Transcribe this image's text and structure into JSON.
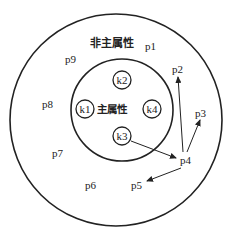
{
  "diagram": {
    "outer_label": "非主属性",
    "inner_label": "主属性",
    "key_nodes": [
      {
        "id": "k1",
        "label": "k1",
        "x": 85,
        "y": 109
      },
      {
        "id": "k2",
        "label": "k2",
        "x": 122,
        "y": 80
      },
      {
        "id": "k3",
        "label": "k3",
        "x": 122,
        "y": 136
      },
      {
        "id": "k4",
        "label": "k4",
        "x": 153,
        "y": 109
      }
    ],
    "points": [
      {
        "id": "p1",
        "label": "p1",
        "x": 150,
        "y": 48
      },
      {
        "id": "p2",
        "label": "p2",
        "x": 179,
        "y": 73
      },
      {
        "id": "p3",
        "label": "p3",
        "x": 200,
        "y": 117
      },
      {
        "id": "p4",
        "label": "p4",
        "x": 185,
        "y": 160
      },
      {
        "id": "p5",
        "label": "p5",
        "x": 133,
        "y": 187
      },
      {
        "id": "p6",
        "label": "p6",
        "x": 89,
        "y": 188
      },
      {
        "id": "p7",
        "label": "p7",
        "x": 56,
        "y": 155
      },
      {
        "id": "p8",
        "label": "p8",
        "x": 44,
        "y": 108
      },
      {
        "id": "p9",
        "label": "p9",
        "x": 67,
        "y": 60
      }
    ],
    "arrows": [
      {
        "from": "k3",
        "to": "p4"
      },
      {
        "from": "p4",
        "to": "p2"
      },
      {
        "from": "p4",
        "to": "p3"
      },
      {
        "from": "p4",
        "to": "p5"
      }
    ]
  }
}
